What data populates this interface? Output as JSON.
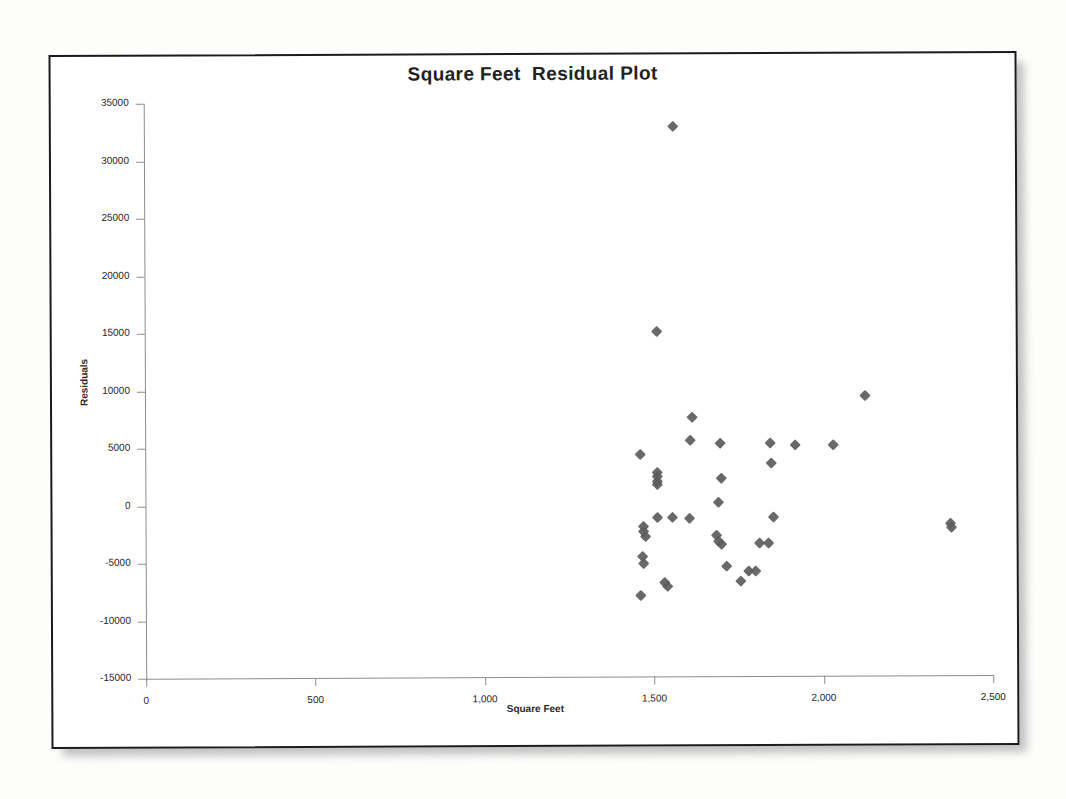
{
  "chart": {
    "title": "Square Feet  Residual Plot",
    "x_axis_title": "Square Feet",
    "y_axis_title": "Residuals",
    "marker_color": "#5c5c5c",
    "frame_color": "#1b1b1b",
    "axis_color": "#8c8c8c"
  },
  "chart_data": {
    "type": "scatter",
    "title": "Square Feet  Residual Plot",
    "xlabel": "Square Feet",
    "ylabel": "Residuals",
    "xlim": [
      0,
      2500
    ],
    "ylim": [
      -15000,
      35000
    ],
    "xticks": [
      0,
      500,
      1000,
      1500,
      2000,
      2500
    ],
    "xticklabels": [
      "0",
      "500",
      "1,000",
      "1,500",
      "2,000",
      "2,500"
    ],
    "yticks": [
      -15000,
      -10000,
      -5000,
      0,
      5000,
      10000,
      15000,
      20000,
      25000,
      30000,
      35000
    ],
    "yticklabels": [
      "-15000",
      "-10000",
      "-5000",
      "0",
      "5000",
      "10000",
      "15000",
      "20000",
      "25000",
      "30000",
      "35000"
    ],
    "grid": false,
    "legend": false,
    "marker": "diamond",
    "series": [
      {
        "name": "Residuals",
        "points": [
          [
            1560,
            32800
          ],
          [
            1512,
            15000
          ],
          [
            2125,
            9350
          ],
          [
            1615,
            7500
          ],
          [
            1608,
            5500
          ],
          [
            1698,
            5250
          ],
          [
            1845,
            5250
          ],
          [
            1920,
            5050
          ],
          [
            2030,
            5100
          ],
          [
            1848,
            3550
          ],
          [
            1462,
            4300
          ],
          [
            1510,
            2700
          ],
          [
            1510,
            2350
          ],
          [
            1510,
            2000
          ],
          [
            1510,
            1700
          ],
          [
            1700,
            2250
          ],
          [
            1690,
            150
          ],
          [
            1512,
            -1150
          ],
          [
            1555,
            -1200
          ],
          [
            1605,
            -1250
          ],
          [
            1855,
            -1150
          ],
          [
            1470,
            -1950
          ],
          [
            1470,
            -2350
          ],
          [
            1477,
            -2800
          ],
          [
            1685,
            -2700
          ],
          [
            1690,
            -3300
          ],
          [
            1700,
            -3550
          ],
          [
            1812,
            -3450
          ],
          [
            1840,
            -3450
          ],
          [
            1468,
            -4600
          ],
          [
            1470,
            -5200
          ],
          [
            1715,
            -5400
          ],
          [
            1780,
            -5850
          ],
          [
            1800,
            -5850
          ],
          [
            1755,
            -6700
          ],
          [
            1532,
            -6850
          ],
          [
            1540,
            -7150
          ],
          [
            1462,
            -7950
          ],
          [
            2375,
            -1750
          ],
          [
            2378,
            -2150
          ]
        ]
      }
    ]
  }
}
